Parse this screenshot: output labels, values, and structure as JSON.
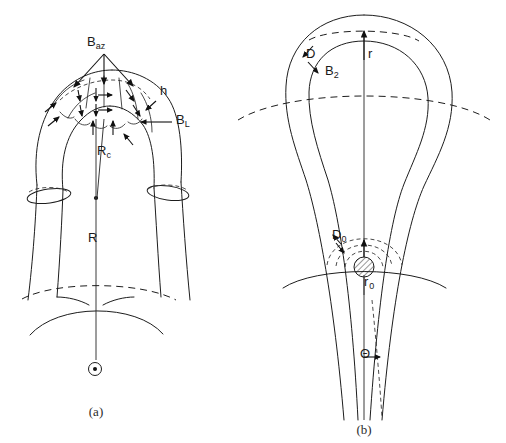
{
  "figure": {
    "background_color": "#ffffff",
    "line_color": "#1d1d1d"
  },
  "panels": [
    {
      "id": "a",
      "caption": "(a)",
      "description": "Perspective view of a D-shaped toroidal field coil showing magnetic field components",
      "labels": [
        {
          "name": "b-az",
          "text": "B",
          "subscript": "az",
          "x": 97,
          "y": 43
        },
        {
          "name": "h",
          "text": "h",
          "subscript": "",
          "x": 160,
          "y": 94
        },
        {
          "name": "b-perp",
          "text": "B",
          "subscript": "L",
          "x": 178,
          "y": 122
        },
        {
          "name": "r-c",
          "text": "R",
          "subscript": "c",
          "x": 103,
          "y": 153
        },
        {
          "name": "r-major",
          "text": "R",
          "subscript": "",
          "x": 96,
          "y": 239
        }
      ],
      "symbols": [
        {
          "name": "axis-out-of-page-symbol",
          "glyph": "circle-dot",
          "x": 95,
          "y": 369
        }
      ]
    },
    {
      "id": "b",
      "caption": "(b)",
      "description": "Plan view of the toroidal field coil showing radial and angular parameters",
      "labels": [
        {
          "name": "d-thickness",
          "text": "D",
          "subscript": "",
          "x": 309,
          "y": 56
        },
        {
          "name": "b-2",
          "text": "B",
          "subscript": "2",
          "x": 331,
          "y": 72
        },
        {
          "name": "r-radius",
          "text": "r",
          "subscript": "",
          "x": 371,
          "y": 56
        },
        {
          "name": "d-zero",
          "text": "D",
          "subscript": "0",
          "x": 336,
          "y": 237
        },
        {
          "name": "r-zero",
          "text": "r",
          "subscript": "0",
          "x": 369,
          "y": 283
        },
        {
          "name": "theta-angle",
          "text": "Θ",
          "subscript": "",
          "x": 366,
          "y": 355
        }
      ]
    }
  ],
  "captions": {
    "panel_a": "(a)",
    "panel_b": "(b)"
  }
}
